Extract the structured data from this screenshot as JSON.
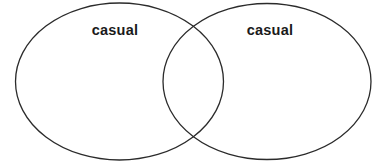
{
  "diagram": {
    "type": "venn-two-set",
    "canvas": {
      "width": 382,
      "height": 165,
      "background_color": "#ffffff"
    },
    "style": {
      "stroke_color": "#2b2b2b",
      "stroke_width": 1.3,
      "fill": "none",
      "label_color": "#1a1a1a"
    },
    "sets": [
      {
        "id": "left-set",
        "label": "casual",
        "center_x": 119.5,
        "center_y": 81.5,
        "radius_x": 104,
        "radius_y": 78.5,
        "label_x": 115,
        "label_y": 30
      },
      {
        "id": "right-set",
        "label": "casual",
        "center_x": 267,
        "center_y": 81.5,
        "radius_x": 104,
        "radius_y": 78,
        "label_x": 270,
        "label_y": 30
      }
    ],
    "intersection": {
      "label": "",
      "crossing_top_x": 193,
      "crossing_top_y": 26,
      "crossing_bottom_x": 193,
      "crossing_bottom_y": 138
    }
  }
}
